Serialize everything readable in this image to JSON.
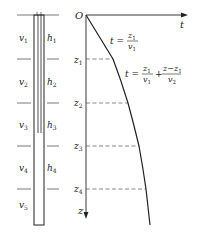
{
  "colors": {
    "ink": "#222222",
    "dashed": "#555555",
    "background": "#ffffff"
  },
  "left_panel": {
    "layers": [
      {
        "velocity": "v",
        "velocity_sub": "1",
        "thickness": "h",
        "thickness_sub": "1"
      },
      {
        "velocity": "v",
        "velocity_sub": "2",
        "thickness": "h",
        "thickness_sub": "2"
      },
      {
        "velocity": "v",
        "velocity_sub": "3",
        "thickness": "h",
        "thickness_sub": "3"
      },
      {
        "velocity": "v",
        "velocity_sub": "4",
        "thickness": "h",
        "thickness_sub": "4"
      },
      {
        "velocity": "v",
        "velocity_sub": "5"
      }
    ]
  },
  "right_panel": {
    "origin_label": "O",
    "t_axis_label": "t",
    "z_axis_label": "z",
    "depth_markers": [
      {
        "label": "z",
        "sub": "1"
      },
      {
        "label": "z",
        "sub": "2"
      },
      {
        "label": "z",
        "sub": "3"
      },
      {
        "label": "z",
        "sub": "4"
      }
    ],
    "equation1": {
      "lhs": "t =",
      "num": "z",
      "num_sub": "1",
      "den": "v",
      "den_sub": "1"
    },
    "equation2": {
      "lhs": "t =",
      "frac1_num": "z",
      "frac1_num_sub": "1",
      "frac1_den": "v",
      "frac1_den_sub": "1",
      "plus": "+",
      "frac2_num": "z−z",
      "frac2_num_sub": "1",
      "frac2_den": "v",
      "frac2_den_sub": "2"
    }
  }
}
